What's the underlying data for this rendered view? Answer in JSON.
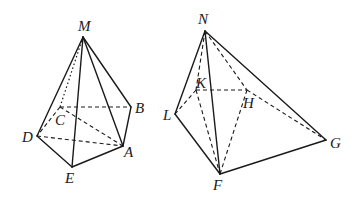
{
  "figures": [
    {
      "name": "pyramid-M",
      "vertices": {
        "M": {
          "label": "M",
          "x": 83,
          "y": 37,
          "lx": 78,
          "ly": 31
        },
        "B": {
          "label": "B",
          "x": 131,
          "y": 107,
          "lx": 135,
          "ly": 113
        },
        "C": {
          "label": "C",
          "x": 60,
          "y": 107,
          "lx": 55,
          "ly": 125
        },
        "D": {
          "label": "D",
          "x": 37,
          "y": 136,
          "lx": 22,
          "ly": 142
        },
        "A": {
          "label": "A",
          "x": 123,
          "y": 146,
          "lx": 124,
          "ly": 157
        },
        "E": {
          "label": "E",
          "x": 72,
          "y": 167,
          "lx": 65,
          "ly": 183
        }
      },
      "solid_edges": [
        [
          "M",
          "D"
        ],
        [
          "M",
          "E"
        ],
        [
          "M",
          "A"
        ],
        [
          "M",
          "B"
        ],
        [
          "D",
          "E"
        ],
        [
          "E",
          "A"
        ],
        [
          "A",
          "B"
        ]
      ],
      "dashed_edges": [
        [
          "C",
          "B"
        ],
        [
          "C",
          "D"
        ],
        [
          "C",
          "A"
        ],
        [
          "D",
          "A"
        ]
      ],
      "dotted_edges": [
        [
          "M",
          "C"
        ]
      ]
    },
    {
      "name": "pyramid-N",
      "vertices": {
        "N": {
          "label": "N",
          "x": 205,
          "y": 31,
          "lx": 198,
          "ly": 24
        },
        "K": {
          "label": "K",
          "x": 196,
          "y": 90,
          "lx": 196,
          "ly": 88
        },
        "H": {
          "label": "H",
          "x": 247,
          "y": 90,
          "lx": 243,
          "ly": 108
        },
        "L": {
          "label": "L",
          "x": 175,
          "y": 114,
          "lx": 163,
          "ly": 120
        },
        "G": {
          "label": "G",
          "x": 326,
          "y": 140,
          "lx": 330,
          "ly": 148
        },
        "F": {
          "label": "F",
          "x": 220,
          "y": 174,
          "lx": 213,
          "ly": 190
        }
      },
      "solid_edges": [
        [
          "N",
          "L"
        ],
        [
          "N",
          "F"
        ],
        [
          "N",
          "G"
        ],
        [
          "L",
          "F"
        ],
        [
          "F",
          "G"
        ]
      ],
      "dashed_edges": [
        [
          "N",
          "K"
        ],
        [
          "N",
          "H"
        ],
        [
          "K",
          "H"
        ],
        [
          "K",
          "L"
        ],
        [
          "K",
          "F"
        ],
        [
          "H",
          "F"
        ],
        [
          "H",
          "G"
        ]
      ],
      "dotted_edges": []
    }
  ]
}
